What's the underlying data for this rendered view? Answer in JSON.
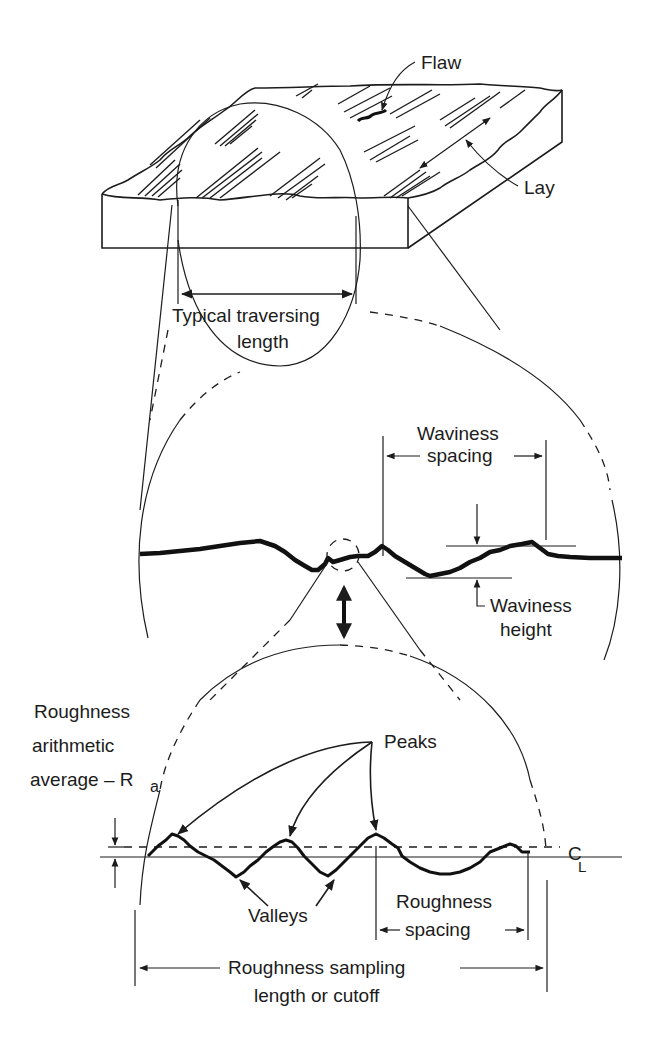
{
  "figure": {
    "colors": {
      "ink": "#1c1c1c",
      "background": "#ffffff"
    }
  },
  "specimen": {
    "flaw_label": "Flaw",
    "lay_label": "Lay",
    "traversing_label_line1": "Typical traversing",
    "traversing_label_line2": "length"
  },
  "waviness": {
    "spacing_label_line1": "Waviness",
    "spacing_label_line2": "spacing",
    "height_label_line1": "Waviness",
    "height_label_line2": "height"
  },
  "roughness": {
    "ra_label_line1": "Roughness",
    "ra_label_line2": "arithmetic",
    "ra_label_line3": "average – R",
    "ra_subscript": "a",
    "peaks_label": "Peaks",
    "valleys_label": "Valleys",
    "centerline_label": "C",
    "centerline_sub": "L",
    "spacing_label_line1": "Roughness",
    "spacing_label_line2": "spacing",
    "sampling_label_line1": "Roughness sampling",
    "sampling_label_line2": "length or cutoff"
  }
}
